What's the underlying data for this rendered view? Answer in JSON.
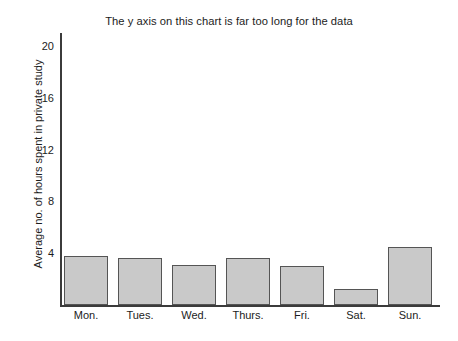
{
  "chart_data": {
    "type": "bar",
    "title": "The y axis on this chart is far too long for the data",
    "xlabel": "",
    "ylabel": "Average no. of hours spent in private study",
    "categories": [
      "Mon.",
      "Tues.",
      "Wed.",
      "Thurs.",
      "Fri.",
      "Sat.",
      "Sun."
    ],
    "values": [
      3.8,
      3.6,
      3.1,
      3.6,
      3.0,
      1.2,
      4.5
    ],
    "ylim": [
      0,
      21
    ],
    "yticks": [
      4,
      8,
      12,
      16,
      20
    ],
    "ytick_labels": [
      "4",
      "8",
      "12",
      "16",
      "20"
    ],
    "grid": false,
    "legend": null,
    "bar_fill_color": "#c9c9c9",
    "bar_edge_color": "#555555",
    "axis_color": "#3b3b3b",
    "background_color": "#ffffff"
  }
}
